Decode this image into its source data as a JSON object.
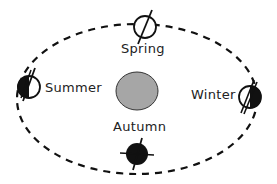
{
  "diagram": {
    "sun": {
      "color": "#a6a6a6",
      "stroke": "#333333"
    },
    "orbit": {
      "style": "dashed",
      "color": "#111111"
    },
    "seasons": [
      {
        "id": "spring",
        "label": "Spring",
        "position": "top"
      },
      {
        "id": "summer",
        "label": "Summer",
        "position": "left"
      },
      {
        "id": "winter",
        "label": "Winter",
        "position": "right"
      },
      {
        "id": "autumn",
        "label": "Autumn",
        "position": "bottom"
      }
    ]
  }
}
